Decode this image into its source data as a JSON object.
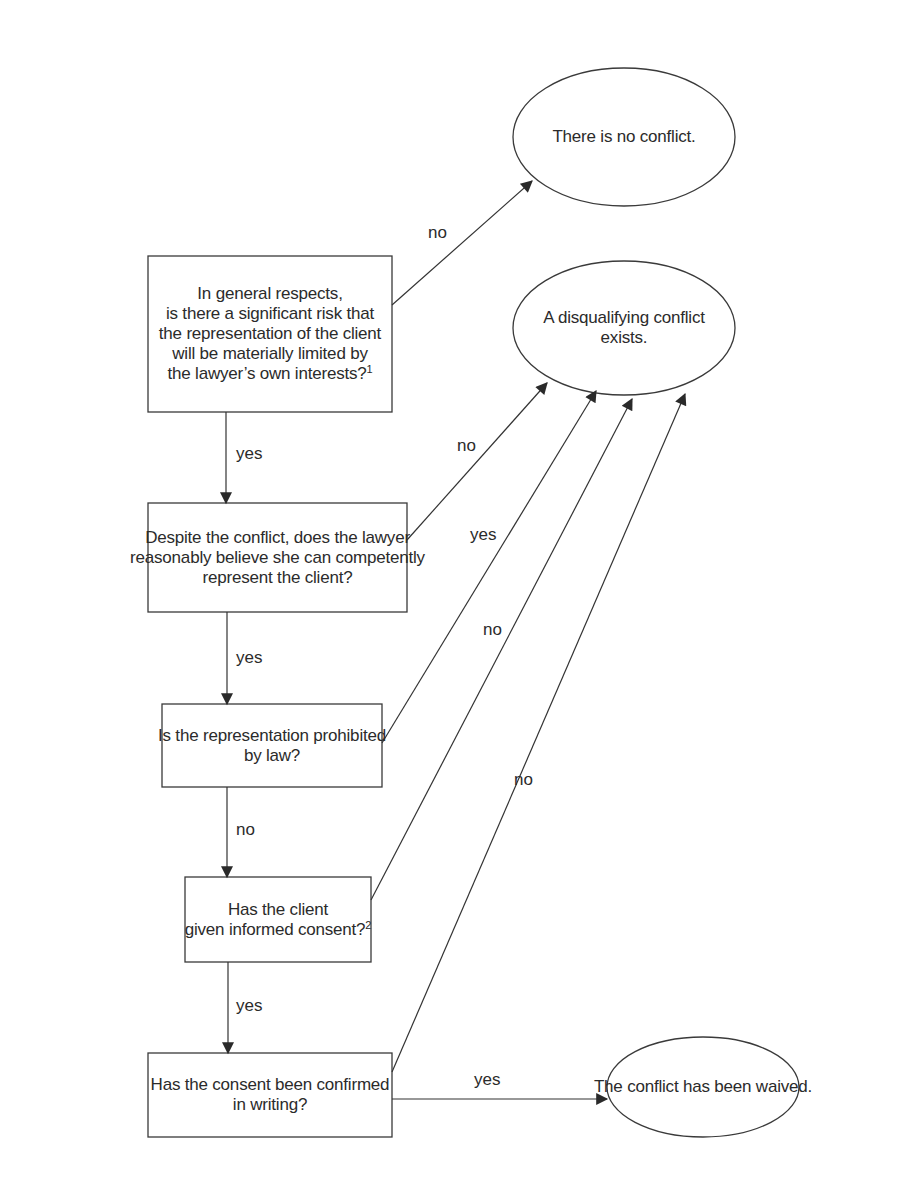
{
  "diagram": {
    "type": "flowchart",
    "title": "",
    "colors": {
      "stroke": "#333333",
      "text": "#2b2b2b",
      "background": "#ffffff"
    },
    "decisions": [
      {
        "id": "q1",
        "lines": [
          "In general respects,",
          "is there a significant risk that",
          "the representation of the client",
          "will be materially limited by",
          "the lawyer’s own interests?"
        ],
        "footnote": "1"
      },
      {
        "id": "q2",
        "lines": [
          "Despite the conflict, does the lawyer",
          "reasonably believe she can competently",
          "represent the client?"
        ],
        "footnote": ""
      },
      {
        "id": "q3",
        "lines": [
          "Is the representation prohibited",
          "by law?"
        ],
        "footnote": ""
      },
      {
        "id": "q4",
        "lines": [
          "Has the client",
          "given informed consent?"
        ],
        "footnote": "2"
      },
      {
        "id": "q5",
        "lines": [
          "Has the consent been confirmed",
          "in writing?"
        ],
        "footnote": ""
      }
    ],
    "outcomes": [
      {
        "id": "o1",
        "lines": [
          "There is no conflict."
        ]
      },
      {
        "id": "o2",
        "lines": [
          "A disqualifying conflict",
          "exists."
        ]
      },
      {
        "id": "o3",
        "lines": [
          "The conflict has been waived."
        ]
      }
    ],
    "edges": [
      {
        "from": "q1",
        "to": "o1",
        "label": "no"
      },
      {
        "from": "q1",
        "to": "q2",
        "label": "yes"
      },
      {
        "from": "q2",
        "to": "o2",
        "label": "no"
      },
      {
        "from": "q2",
        "to": "q3",
        "label": "yes"
      },
      {
        "from": "q3",
        "to": "o2",
        "label": "yes"
      },
      {
        "from": "q3",
        "to": "q4",
        "label": "no"
      },
      {
        "from": "q4",
        "to": "o2",
        "label": "no"
      },
      {
        "from": "q4",
        "to": "q5",
        "label": "yes"
      },
      {
        "from": "q5",
        "to": "o2",
        "label": "no"
      },
      {
        "from": "q5",
        "to": "o3",
        "label": "yes"
      }
    ]
  }
}
